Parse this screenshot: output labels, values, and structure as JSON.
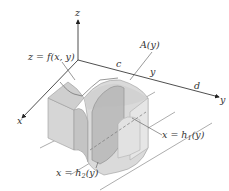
{
  "figure": {
    "type": "3d-solid-cross-section",
    "axes": {
      "x": "x",
      "y": "y",
      "z": "z"
    },
    "labels": {
      "surface": "z = f(x, y)",
      "cross_section": "A(y)",
      "y_lower_bound": "c",
      "y_upper_bound": "d",
      "y_slice": "y",
      "boundary_1": "x = h",
      "boundary_1_sub": "1",
      "boundary_1_arg": "(y)",
      "boundary_2": "x = h",
      "boundary_2_sub": "2",
      "boundary_2_arg": "(y)"
    },
    "colors": {
      "axis": "#333333",
      "solid_light": "#dcdcdc",
      "solid_mid": "#c8c8c8",
      "solid_dark": "#b4b4b4",
      "cross_section": "#a8a8a8",
      "text": "#333333"
    }
  }
}
